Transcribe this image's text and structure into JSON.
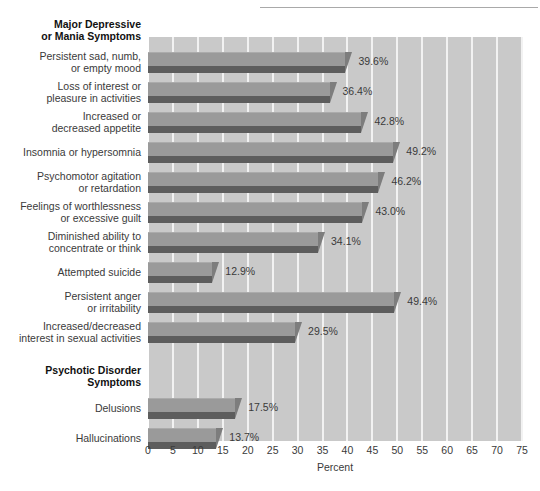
{
  "chart_data": {
    "type": "bar",
    "orientation": "horizontal",
    "title": "",
    "xlabel": "Percent",
    "ylabel": "",
    "xlim": [
      0,
      75
    ],
    "xticks": [
      0,
      5,
      10,
      15,
      20,
      25,
      30,
      35,
      40,
      45,
      50,
      55,
      60,
      65,
      70,
      75
    ],
    "xtick_labels": [
      "0",
      "5",
      "10",
      "15",
      "20",
      "25",
      "30",
      "35",
      "40",
      "45",
      "50",
      "55",
      "60",
      "65",
      "70",
      "75"
    ],
    "grid": true,
    "legend": "none",
    "value_label_suffix": "%",
    "groups": [
      {
        "heading": "Major Depressive\nor Mania Symptoms",
        "categories": [
          "Persistent sad, numb,\nor empty mood",
          "Loss of interest or\npleasure in activities",
          "Increased or\ndecreased appetite",
          "Insomnia or hypersomnia",
          "Psychomotor agitation\nor retardation",
          "Feelings of worthlessness\nor excessive guilt",
          "Diminished ability to\nconcentrate or think",
          "Attempted suicide",
          "Persistent anger\nor irritability",
          "Increased/decreased\ninterest in sexual activities"
        ],
        "values": [
          39.6,
          36.4,
          42.8,
          49.2,
          46.2,
          43.0,
          34.1,
          12.9,
          49.4,
          29.5
        ],
        "value_labels": [
          "39.6%",
          "36.4%",
          "42.8%",
          "49.2%",
          "46.2%",
          "43.0%",
          "34.1%",
          "12.9%",
          "49.4%",
          "29.5%"
        ]
      },
      {
        "heading": "Psychotic Disorder\nSymptoms",
        "categories": [
          "Delusions",
          "Hallucinations"
        ],
        "values": [
          17.5,
          13.7
        ],
        "value_labels": [
          "17.5%",
          "13.7%"
        ]
      }
    ],
    "colors": {
      "plot_background": "#c9c9c9",
      "gridline": "#f2f2f2",
      "bar_top": "#9a9a9a",
      "bar_front": "#5d5d5d",
      "bar_bevel": "#7d7d7d",
      "label_text": "#3a3a3a",
      "heading_text": "#111111"
    }
  }
}
